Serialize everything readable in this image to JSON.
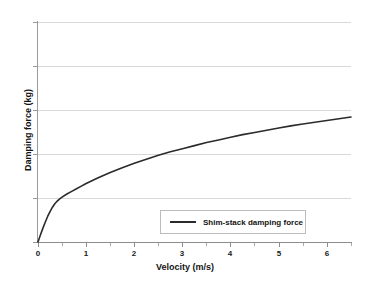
{
  "chart_data": {
    "type": "line",
    "title": "",
    "xlabel": "Velocity (m/s)",
    "ylabel": "Damping force (kg)",
    "xlim": [
      0,
      6.5
    ],
    "ylim": [
      0,
      5
    ],
    "grid": true,
    "legend_position": "inside-bottom-center",
    "x_tick_labels": [
      "0",
      "1",
      "2",
      "3",
      "4",
      "5",
      "6"
    ],
    "x_tick_values": [
      0,
      1,
      2,
      3,
      4,
      5,
      6
    ],
    "x_minor_tick_values": [
      0.5,
      1.5,
      2.5,
      3.5,
      4.5,
      5.5,
      6.5
    ],
    "y_tick_labels": [
      "",
      "",
      "",
      "",
      "",
      ""
    ],
    "y_tick_values": [
      0,
      1,
      2,
      3,
      4,
      5
    ],
    "series": [
      {
        "name": "Shim-stack damping force",
        "color": "#2b2b2b",
        "x": [
          0.0,
          0.05,
          0.1,
          0.15,
          0.2,
          0.25,
          0.3,
          0.35,
          0.4,
          0.45,
          0.5,
          0.6,
          0.7,
          0.8,
          0.9,
          1.0,
          1.25,
          1.5,
          1.75,
          2.0,
          2.25,
          2.5,
          2.75,
          3.0,
          3.25,
          3.5,
          3.75,
          4.0,
          4.25,
          4.5,
          4.75,
          5.0,
          5.25,
          5.5,
          5.75,
          6.0,
          6.25,
          6.5
        ],
        "y": [
          0.0,
          0.16,
          0.31,
          0.45,
          0.58,
          0.69,
          0.79,
          0.87,
          0.93,
          0.98,
          1.02,
          1.09,
          1.15,
          1.21,
          1.27,
          1.33,
          1.46,
          1.58,
          1.69,
          1.79,
          1.88,
          1.97,
          2.05,
          2.12,
          2.19,
          2.26,
          2.32,
          2.38,
          2.44,
          2.49,
          2.54,
          2.59,
          2.64,
          2.68,
          2.72,
          2.76,
          2.8,
          2.84
        ]
      }
    ]
  },
  "legend": {
    "entries": [
      {
        "label": "Shim-stack damping force"
      }
    ]
  }
}
